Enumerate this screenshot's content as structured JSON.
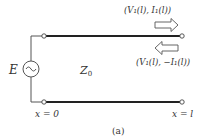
{
  "figure": {
    "caption": "(a)",
    "source": {
      "label": "E",
      "symbol": "ac-voltage-source"
    },
    "line": {
      "impedance_label": "Z",
      "impedance_sub": "0"
    },
    "positions": {
      "left": "x = 0",
      "right": "x = l"
    },
    "forward_wave": {
      "label": "(V₁(l), I₁(l))",
      "direction": "right"
    },
    "reflected_wave": {
      "label": "(V₁(l), −I₁(l))",
      "direction": "left"
    }
  },
  "colors": {
    "line": "#222222",
    "wire": "#555555",
    "text": "#333333"
  }
}
